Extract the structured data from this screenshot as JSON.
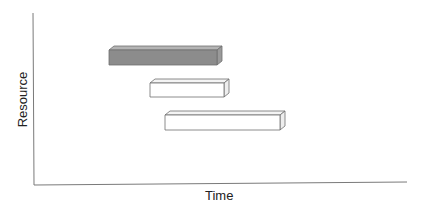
{
  "chart_data": {
    "type": "bar",
    "subtype": "gantt-3d",
    "title": "",
    "xlabel": "Time",
    "ylabel": "Resource",
    "grid": false,
    "legend": null,
    "x_ticks": [],
    "y_ticks": [],
    "xlim": [
      0,
      100
    ],
    "series": [
      {
        "name": "task-1",
        "start": 20,
        "end": 49,
        "row": 1,
        "fill": "#8c8c8c"
      },
      {
        "name": "task-2",
        "start": 31,
        "end": 51,
        "row": 2,
        "fill": "#ffffff"
      },
      {
        "name": "task-3",
        "start": 35,
        "end": 66,
        "row": 3,
        "fill": "#ffffff"
      }
    ]
  },
  "labels": {
    "x": "Time",
    "y": "Resource"
  },
  "colors": {
    "axis": "#7a7a7a",
    "edge": "#6e6e6e",
    "filled_front": "#8c8c8c",
    "filled_top": "#b4b4b4",
    "filled_side": "#9a9a9a",
    "empty_front": "#ffffff",
    "empty_top": "#f4f4f4",
    "empty_side": "#eeeeee"
  }
}
